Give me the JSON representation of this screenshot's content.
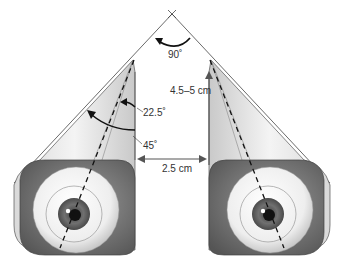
{
  "diagram": {
    "labels": {
      "apex_angle": "90˚",
      "orbit_depth": "4.5–5 cm",
      "axis_angle_small": "22.5˚",
      "axis_angle_large": "45˚",
      "interorbital_distance": "2.5 cm"
    },
    "components": [
      {
        "name": "left-orbit",
        "type": "cone"
      },
      {
        "name": "right-orbit",
        "type": "cone"
      },
      {
        "name": "left-eye",
        "type": "eyeball"
      },
      {
        "name": "right-eye",
        "type": "eyeball"
      },
      {
        "name": "visual-axis-left",
        "type": "dashed-line"
      },
      {
        "name": "visual-axis-right",
        "type": "dashed-line"
      },
      {
        "name": "lateral-wall-lines",
        "type": "converging-lines"
      }
    ],
    "colors": {
      "line": "#333333",
      "orbit_fill": "#e6e6e6",
      "orbit_shadow": "#6e6e6e",
      "iris": "#6a6a6a",
      "pupil": "#111111"
    }
  }
}
